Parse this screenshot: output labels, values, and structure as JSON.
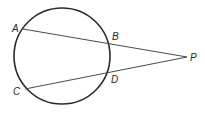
{
  "diagram": {
    "circle": {
      "cx": 62,
      "cy": 56,
      "r": 48
    },
    "points": {
      "A": {
        "label": "A",
        "x": 23,
        "y": 29,
        "lx": 12,
        "ly": 32
      },
      "B": {
        "label": "B",
        "x": 110,
        "y": 43,
        "lx": 112,
        "ly": 40
      },
      "C": {
        "label": "C",
        "x": 25,
        "y": 89,
        "lx": 13,
        "ly": 95
      },
      "D": {
        "label": "D",
        "x": 110,
        "y": 72,
        "lx": 111,
        "ly": 83
      },
      "P": {
        "label": "P",
        "x": 187,
        "y": 57,
        "lx": 190,
        "ly": 61
      }
    },
    "segments": [
      {
        "name": "secant-APB",
        "from": "A",
        "to": "P"
      },
      {
        "name": "secant-CPD",
        "from": "C",
        "to": "P"
      }
    ],
    "colors": {
      "stroke": "#2a2a2a",
      "line": "#4a4a4a",
      "background": "#ffffff"
    }
  }
}
